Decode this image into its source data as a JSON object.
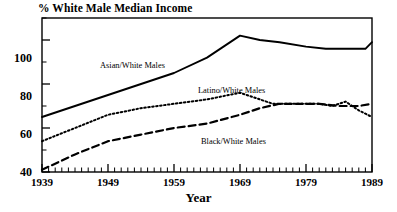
{
  "chart_data": {
    "type": "line",
    "title": "% White Male Median Income",
    "xlabel": "Year",
    "ylabel": "",
    "xlim": [
      1939,
      1989
    ],
    "ylim": [
      40,
      110
    ],
    "grid": false,
    "legend_position": "inline-annotations",
    "yticks": [
      40,
      60,
      80,
      100
    ],
    "xticks": [
      1939,
      1949,
      1959,
      1969,
      1979,
      1989
    ],
    "x_minor_tick_interval": 1,
    "series": [
      {
        "name": "Asian/White Males",
        "style": "solid",
        "color": "#000000",
        "x": [
          1939,
          1944,
          1949,
          1954,
          1959,
          1964,
          1969,
          1972,
          1975,
          1979,
          1982,
          1985,
          1987,
          1988,
          1989
        ],
        "values": [
          65,
          70,
          75,
          80,
          85,
          92,
          102,
          100,
          99,
          97,
          96,
          96,
          96,
          96,
          99
        ]
      },
      {
        "name": "Latino/White Males",
        "style": "dotted",
        "color": "#000000",
        "x": [
          1939,
          1944,
          1949,
          1954,
          1959,
          1964,
          1969,
          1971,
          1974,
          1977,
          1979,
          1981,
          1983,
          1985,
          1987,
          1989
        ],
        "values": [
          54,
          60,
          66,
          69,
          71,
          73,
          76,
          74,
          71,
          71,
          71,
          71,
          70,
          72,
          68,
          65
        ]
      },
      {
        "name": "Black/White Males",
        "style": "dashed",
        "color": "#000000",
        "x": [
          1939,
          1944,
          1949,
          1954,
          1959,
          1964,
          1969,
          1972,
          1975,
          1978,
          1981,
          1984,
          1987,
          1989
        ],
        "values": [
          41,
          48,
          54,
          57,
          60,
          62,
          66,
          69,
          71,
          71,
          71,
          70,
          70,
          71
        ]
      }
    ],
    "annotations": [
      {
        "text": "Asian/White Males",
        "x": 1953.5,
        "y": 92
      },
      {
        "text": "Latino/White Males",
        "x": 1968.5,
        "y": 84
      },
      {
        "text": "Black/White Males",
        "x": 1969.5,
        "y": 56
      }
    ]
  },
  "axis": {
    "y_tick_labels": [
      "100",
      "80",
      "60",
      "40"
    ],
    "x_tick_labels": [
      "1939",
      "1949",
      "1959",
      "1969",
      "1979",
      "1989"
    ]
  }
}
